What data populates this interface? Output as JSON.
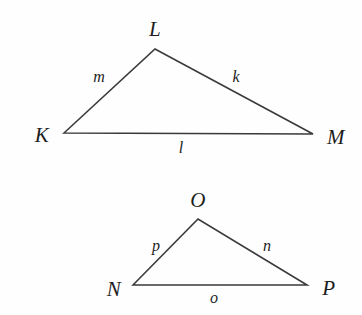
{
  "figure": {
    "background_color": "#fefefe",
    "stroke_color": "#3a3a3a",
    "text_color": "#1d1d1d",
    "width": 362,
    "height": 315
  },
  "triangles": [
    {
      "name": "triangle-klm",
      "vertices": [
        {
          "label": "K",
          "x": 64,
          "y": 133,
          "label_x": 42,
          "label_y": 135
        },
        {
          "label": "L",
          "x": 155,
          "y": 49,
          "label_x": 155,
          "label_y": 29
        },
        {
          "label": "M",
          "x": 313,
          "y": 134,
          "label_x": 336,
          "label_y": 137
        }
      ],
      "sides": [
        {
          "label": "m",
          "from": "K",
          "to": "L",
          "label_x": 99,
          "label_y": 77
        },
        {
          "label": "k",
          "from": "L",
          "to": "M",
          "label_x": 236,
          "label_y": 77
        },
        {
          "label": "l",
          "from": "K",
          "to": "M",
          "label_x": 181,
          "label_y": 148
        }
      ]
    },
    {
      "name": "triangle-nop",
      "vertices": [
        {
          "label": "N",
          "x": 133,
          "y": 285,
          "label_x": 114,
          "label_y": 289
        },
        {
          "label": "O",
          "x": 198,
          "y": 219,
          "label_x": 198,
          "label_y": 200
        },
        {
          "label": "P",
          "x": 307,
          "y": 285,
          "label_x": 329,
          "label_y": 288
        }
      ],
      "sides": [
        {
          "label": "p",
          "from": "N",
          "to": "O",
          "label_x": 156,
          "label_y": 246
        },
        {
          "label": "n",
          "from": "O",
          "to": "P",
          "label_x": 267,
          "label_y": 246
        },
        {
          "label": "o",
          "from": "N",
          "to": "P",
          "label_x": 214,
          "label_y": 298
        }
      ]
    }
  ]
}
